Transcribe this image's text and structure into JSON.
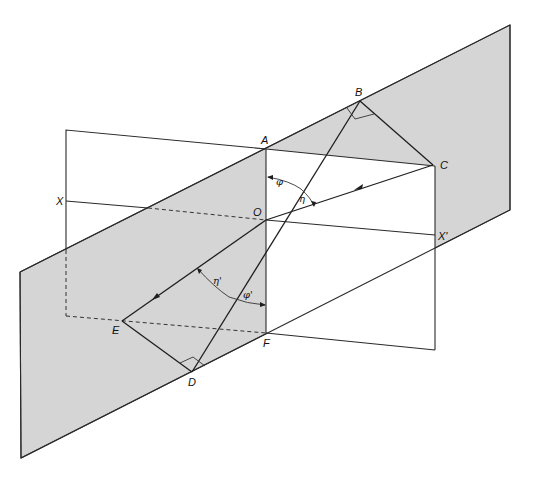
{
  "labels": {
    "A": "A",
    "B": "B",
    "C": "C",
    "O": "O",
    "X": "X",
    "X_prime": "X'",
    "E": "E",
    "D": "D",
    "F": "F",
    "phi": "φ",
    "eta": "η",
    "phi_prime": "φ'",
    "eta_prime": "η'"
  },
  "colors": {
    "plane_fill": "#d5d5d5",
    "line": "#2a2a2a",
    "background": "#ffffff"
  },
  "points": {
    "A": [
      266,
      149
    ],
    "B": [
      360,
      101
    ],
    "C": [
      433,
      165
    ],
    "O": [
      266,
      220
    ],
    "X": [
      66,
      201
    ],
    "X_prime": [
      435,
      235
    ],
    "E": [
      122,
      321
    ],
    "D": [
      192,
      372
    ],
    "F": [
      266,
      333
    ]
  }
}
